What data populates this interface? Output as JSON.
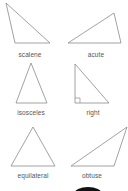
{
  "diagram": {
    "line_color": "#8a8a8a",
    "label_color": "#555555",
    "triangles": [
      {
        "name": "scalene",
        "label": "scalene",
        "points": "6,3 15,43 50,43",
        "label_x": 0,
        "label_y": 51
      },
      {
        "name": "acute",
        "label": "acute",
        "points": "68,43 114,13 121,43",
        "label_x": 66,
        "label_y": 51
      },
      {
        "name": "isosceles",
        "label": "isosceles",
        "points": "31,63 16,103 47,103",
        "label_x": 1,
        "label_y": 109
      },
      {
        "name": "right",
        "label": "right",
        "points": "75,64 75,103 109,103",
        "label_x": 63,
        "label_y": 109
      },
      {
        "name": "equilateral",
        "label": "equilateral",
        "points": "33,127 11,166 55,166",
        "label_x": 3,
        "label_y": 172
      },
      {
        "name": "obtuse",
        "label": "obtuse",
        "points": "71,166 127,127 114,166",
        "label_x": 62,
        "label_y": 172
      }
    ]
  }
}
